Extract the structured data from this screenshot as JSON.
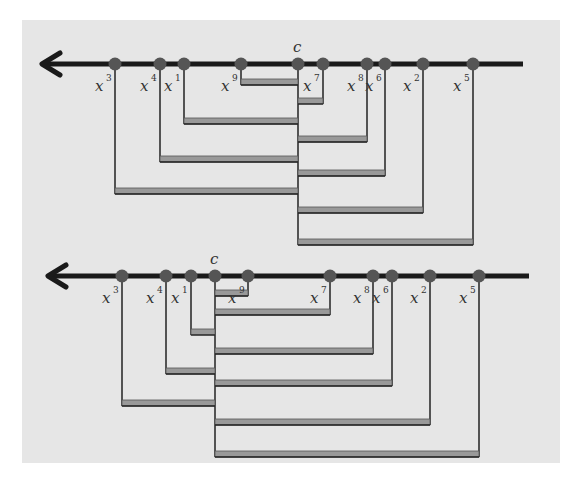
{
  "colors": {
    "background": "#e6e6e6",
    "axis": "#1a1a1a",
    "node": "#555555",
    "connector": "#222222",
    "bar_fill": "#999999"
  },
  "diagrams": [
    {
      "name": "top",
      "axis_y": 64,
      "arrow_tip_x": 42,
      "axis_end_x": 523,
      "center": {
        "label": "c",
        "x": 298
      },
      "nodes": [
        {
          "label": "x",
          "sup": "3",
          "x": 115,
          "bar_y": 190
        },
        {
          "label": "x",
          "sup": "4",
          "x": 160,
          "bar_y": 158
        },
        {
          "label": "x",
          "sup": "1",
          "x": 184,
          "bar_y": 120
        },
        {
          "label": "x",
          "sup": "9",
          "x": 241,
          "bar_y": 81
        },
        {
          "label": "x",
          "sup": "7",
          "x": 323,
          "bar_y": 100
        },
        {
          "label": "x",
          "sup": "8",
          "x": 367,
          "bar_y": 138
        },
        {
          "label": "x",
          "sup": "6",
          "x": 385,
          "bar_y": 172
        },
        {
          "label": "x",
          "sup": "2",
          "x": 423,
          "bar_y": 209
        },
        {
          "label": "x",
          "sup": "5",
          "x": 473,
          "bar_y": 241
        }
      ]
    },
    {
      "name": "bottom",
      "axis_y": 276,
      "arrow_tip_x": 48,
      "axis_end_x": 529,
      "center": {
        "label": "c",
        "x": 215
      },
      "nodes": [
        {
          "label": "x",
          "sup": "3",
          "x": 122,
          "bar_y": 402
        },
        {
          "label": "x",
          "sup": "4",
          "x": 166,
          "bar_y": 370
        },
        {
          "label": "x",
          "sup": "1",
          "x": 191,
          "bar_y": 331
        },
        {
          "label": "x",
          "sup": "9",
          "x": 248,
          "bar_y": 292
        },
        {
          "label": "x",
          "sup": "7",
          "x": 330,
          "bar_y": 311
        },
        {
          "label": "x",
          "sup": "8",
          "x": 373,
          "bar_y": 350
        },
        {
          "label": "x",
          "sup": "6",
          "x": 392,
          "bar_y": 382
        },
        {
          "label": "x",
          "sup": "2",
          "x": 430,
          "bar_y": 421
        },
        {
          "label": "x",
          "sup": "5",
          "x": 479,
          "bar_y": 453
        }
      ]
    }
  ]
}
